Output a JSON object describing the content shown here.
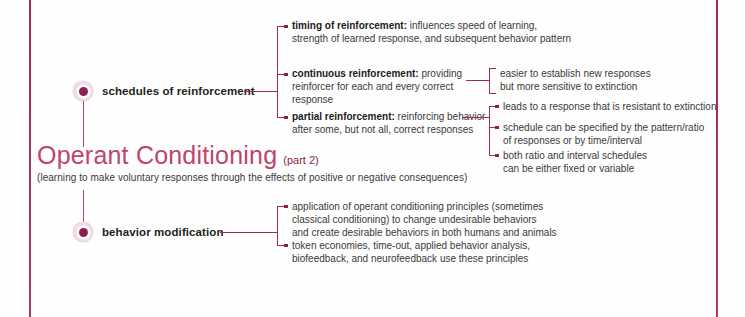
{
  "page": {
    "accent_color": "#9e2a5c",
    "title_color": "#c0446b",
    "node_color": "#8d2050",
    "background": "#fefefe"
  },
  "title": {
    "main": "Operant Conditioning",
    "part": "(part 2)",
    "subtitle": "(learning to make voluntary responses through the effects of positive or negative consequences)"
  },
  "nodes": [
    {
      "label": "schedules of reinforcement"
    },
    {
      "label": "behavior modification"
    }
  ],
  "branches": {
    "schedules": [
      {
        "lead": "timing of reinforcement:",
        "rest": " influences speed of learning,",
        "line2": "strength of learned response, and subsequent behavior pattern",
        "children": []
      },
      {
        "lead": "continuous reinforcement:",
        "rest": " providing",
        "line2": "reinforcer for each and every correct response",
        "children": [
          {
            "line1": "easier to establish new responses",
            "line2": "but more sensitive to extinction"
          }
        ]
      },
      {
        "lead": "partial reinforcement:",
        "rest": " reinforcing behavior",
        "line2": "after some, but not all, correct responses",
        "children": [
          {
            "line1": "leads to a response that is resistant to extinction",
            "line2": ""
          },
          {
            "line1": "schedule can be specified by the pattern/ratio",
            "line2": "of responses or by time/interval"
          },
          {
            "line1": "both ratio and interval schedules",
            "line2": "can be either fixed or variable"
          }
        ]
      }
    ],
    "behavior": [
      {
        "line1": "application of operant conditioning principles (sometimes",
        "line2": "classical conditioning) to change undesirable behaviors",
        "line3": "and create desirable behaviors in both humans and animals"
      },
      {
        "line1": "token economies, time-out, applied behavior analysis,",
        "line2": "biofeedback, and neurofeedback use these principles",
        "line3": ""
      }
    ]
  }
}
